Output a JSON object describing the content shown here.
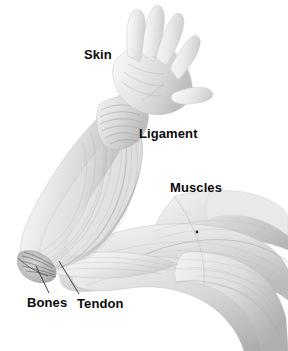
{
  "figure": {
    "background_color": "#ffffff",
    "width": 288,
    "height": 351,
    "style": "grayscale anatomical illustration"
  },
  "labels": [
    {
      "id": "skin",
      "text": "Skin",
      "x": 84,
      "y": 48,
      "has_leader_line": false
    },
    {
      "id": "ligament",
      "text": "Ligament",
      "x": 139,
      "y": 127,
      "has_leader_line": false
    },
    {
      "id": "muscles",
      "text": "Muscles",
      "x": 170,
      "y": 181,
      "has_leader_line": false
    },
    {
      "id": "bones",
      "text": "Bones",
      "x": 27,
      "y": 296,
      "has_leader_line": true
    },
    {
      "id": "tendon",
      "text": "Tendon",
      "x": 77,
      "y": 297,
      "has_leader_line": true
    }
  ],
  "leader_lines": [
    {
      "id": "bones-leader",
      "from_x": 49,
      "from_y": 293,
      "to_x": 36,
      "to_y": 266,
      "color": "#2b2b2b"
    },
    {
      "id": "tendon-leader",
      "from_x": 79,
      "from_y": 294,
      "to_x": 59,
      "to_y": 261,
      "color": "#2b2b2b"
    }
  ],
  "anatomy_parts": [
    {
      "id": "hand",
      "label_ref": "skin",
      "region": "upper-center, open palm with five spread fingers, thumb to the right"
    },
    {
      "id": "wrist",
      "label_ref": "ligament",
      "region": "center, banded fibrous wrist with striping"
    },
    {
      "id": "forearm",
      "label_ref": null,
      "region": "left, elongated muscle bellies descending to elbow"
    },
    {
      "id": "elbow-joint",
      "label_ref": "bones",
      "region": "lower-left, converging dark tendon and bone attachment"
    },
    {
      "id": "tendon-band",
      "label_ref": "tendon",
      "region": "lower-left of mid-arm, pale narrow band"
    },
    {
      "id": "upper-arm",
      "label_ref": "muscles",
      "region": "right, large overlapping muscle bands fanning toward shoulder"
    }
  ],
  "marker_dot": {
    "id": "muscle-marker-dot",
    "x": 197,
    "y": 232,
    "color": "#2a2a2a"
  },
  "colors": {
    "background": "#ffffff",
    "label_text": "#0a0a0a",
    "leader_line": "#2b2b2b",
    "tissue_light": "#f0f0f0",
    "tissue_mid": "#d8d8d8",
    "tissue_shadow": "#a8a8a8",
    "tissue_dark": "#7a7a7a"
  }
}
